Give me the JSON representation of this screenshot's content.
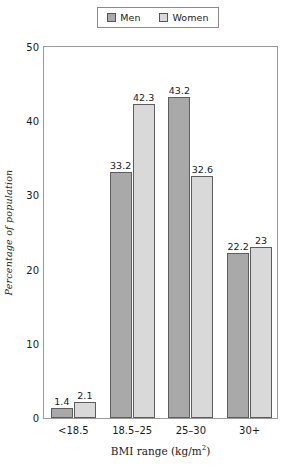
{
  "chart_data": {
    "type": "bar",
    "title": "",
    "xlabel": "BMI range (kg/m²)",
    "xlabel_base": "BMI range (kg/m",
    "xlabel_sup": "2",
    "xlabel_tail": ")",
    "ylabel": "Percentage of population",
    "categories": [
      "<18.5",
      "18.5–25",
      "25–30",
      "30+"
    ],
    "series": [
      {
        "name": "Men",
        "values": [
          1.4,
          33.2,
          43.2,
          22.2
        ],
        "color": "#a9a9a9"
      },
      {
        "name": "Women",
        "values": [
          2.1,
          42.3,
          32.6,
          23
        ],
        "color": "#d9d9d9"
      }
    ],
    "value_labels": {
      "men": [
        "1.4",
        "33.2",
        "43.2",
        "22.2"
      ],
      "women": [
        "2.1",
        "42.3",
        "32.6",
        "23"
      ]
    },
    "ylim": [
      0,
      50
    ],
    "yticks": [
      0,
      10,
      20,
      30,
      40,
      50
    ],
    "ytick_labels": [
      "0",
      "10",
      "20",
      "30",
      "40",
      "50"
    ],
    "grid": false,
    "legend_position": "top-center"
  },
  "legend": {
    "entries": [
      {
        "label": "Men",
        "swatch_color": "#a9a9a9"
      },
      {
        "label": "Women",
        "swatch_color": "#d9d9d9"
      }
    ]
  }
}
